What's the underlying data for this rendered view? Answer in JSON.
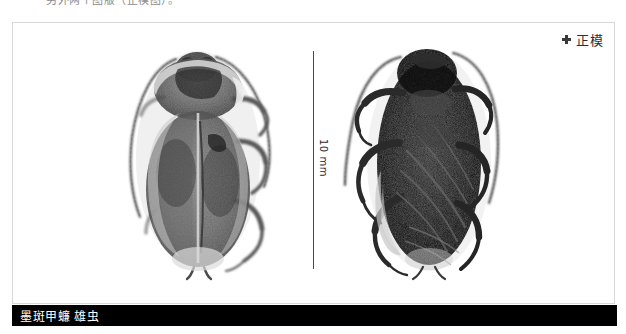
{
  "header": {
    "clipped_line": "另外两个图版（正模图）。"
  },
  "plate": {
    "holotype": {
      "marker_icon": "holotype-cross-icon",
      "label": "正模"
    },
    "scale_bar": {
      "label": "10 mm",
      "orientation": "vertical"
    },
    "specimens": [
      {
        "name": "dorsal-view",
        "view": "dorsal"
      },
      {
        "name": "ventral-view",
        "view": "ventral"
      }
    ]
  },
  "caption": {
    "text": "墨斑甲蠊 雄虫"
  },
  "colors": {
    "caption_bar_bg": "#000000",
    "caption_text": "#ffffff",
    "frame_border": "#d8d8d8",
    "page_bg": "#ffffff",
    "scale_line": "#4a4a4a",
    "label_text": "#2e2e2e"
  }
}
